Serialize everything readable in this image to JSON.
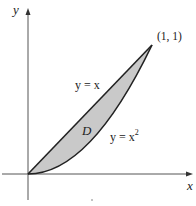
{
  "diagram": {
    "title": "",
    "axes": {
      "x_label": "x",
      "y_label": "y"
    },
    "curves": [
      {
        "id": "line",
        "label": "y = x",
        "equation": "y = x"
      },
      {
        "id": "parabola",
        "label_base": "y = x",
        "label_exp": "2",
        "equation": "y = x^2"
      }
    ],
    "region": {
      "label": "D",
      "fill": "#c9c9c9",
      "description": "region between y = x and y = x^2 for 0 ≤ x ≤ 1"
    },
    "points": [
      {
        "label": "(1, 1)",
        "x": 1,
        "y": 1
      }
    ],
    "colors": {
      "axis": "#555555",
      "curve": "#222222",
      "fill": "#c9c9c9",
      "text": "#222222"
    }
  }
}
